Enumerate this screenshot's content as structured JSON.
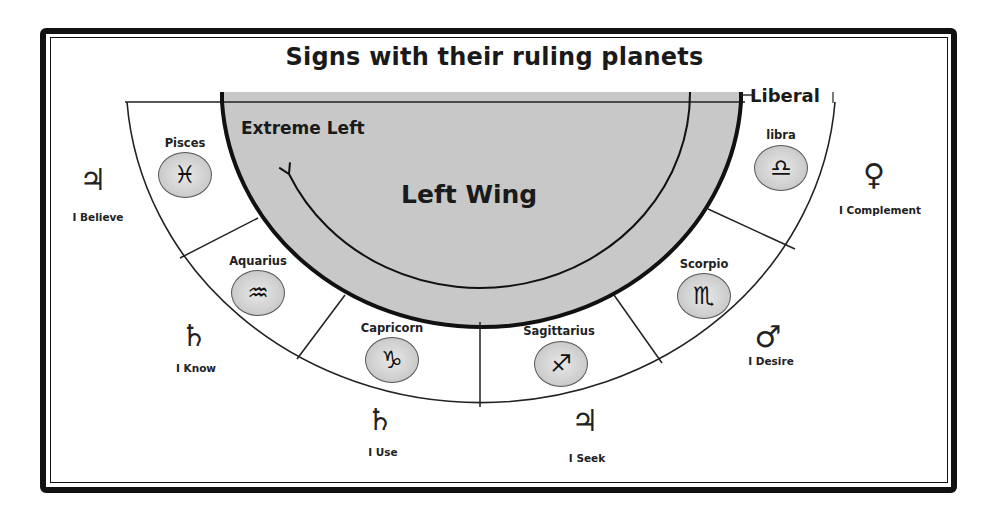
{
  "title": "Signs with their ruling planets",
  "zones": {
    "extreme_left": "Extreme Left",
    "left_wing": "Left Wing",
    "liberal": "Liberal"
  },
  "colors": {
    "frame": "#111111",
    "left_wing_fill": "#c8c8c8",
    "badge_fill": "#cfcfcf",
    "text": "#222222"
  },
  "signs": [
    {
      "name": "Pisces",
      "glyph": "♓",
      "planet_glyph": "♃",
      "planet": "Jupiter",
      "caption": "I Believe"
    },
    {
      "name": "Aquarius",
      "glyph": "♒",
      "planet_glyph": "♄",
      "planet": "Saturn",
      "caption": "I Know"
    },
    {
      "name": "Capricorn",
      "glyph": "♑",
      "planet_glyph": "♄",
      "planet": "Saturn",
      "caption": "I Use"
    },
    {
      "name": "Sagittarius",
      "glyph": "♐",
      "planet_glyph": "♃",
      "planet": "Jupiter",
      "caption": "I Seek"
    },
    {
      "name": "Scorpio",
      "glyph": "♏",
      "planet_glyph": "♂",
      "planet": "Mars",
      "caption": "I Desire"
    },
    {
      "name": "libra",
      "glyph": "♎",
      "planet_glyph": "♀",
      "planet": "Venus",
      "caption": "I Complement"
    }
  ]
}
